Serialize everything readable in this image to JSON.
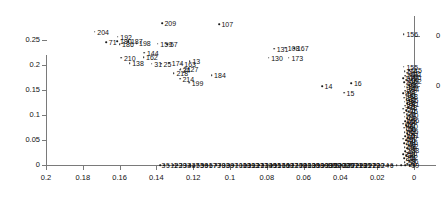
{
  "chart_data": {
    "type": "scatter",
    "title": "",
    "xlabel": "",
    "ylabel": "",
    "xlim": [
      0.2,
      0.0
    ],
    "ylim": [
      0.0,
      0.27
    ],
    "x_reversed": true,
    "grid": false,
    "legend": "none",
    "xticks": [
      "0.2",
      "0.18",
      "0.16",
      "0.14",
      "0.12",
      "0.1",
      "0.08",
      "0.06",
      "0.04",
      "0.02",
      "0"
    ],
    "xtick_values": [
      0.2,
      0.18,
      0.16,
      0.14,
      0.12,
      0.1,
      0.08,
      0.06,
      0.04,
      0.02,
      0
    ],
    "yticks": [
      "0",
      "0.05",
      "0.1",
      "0.15",
      "0.2",
      "0.25"
    ],
    "ytick_values": [
      0,
      0.05,
      0.1,
      0.15,
      0.2,
      0.25
    ],
    "right_axis": {
      "visible": true,
      "clipped": true,
      "ticklabels": [
        "0",
        "0"
      ]
    },
    "points": [
      {
        "label": "204",
        "x": 0.1735,
        "y": 0.2665
      },
      {
        "label": "192",
        "x": 0.161,
        "y": 0.2565
      },
      {
        "label": "71",
        "x": 0.1672,
        "y": 0.2455
      },
      {
        "label": "180",
        "x": 0.1612,
        "y": 0.248
      },
      {
        "label": "187",
        "x": 0.1552,
        "y": 0.248
      },
      {
        "label": "198",
        "x": 0.1508,
        "y": 0.244
      },
      {
        "label": "186",
        "x": 0.16,
        "y": 0.2415
      },
      {
        "label": "159",
        "x": 0.1392,
        "y": 0.243
      },
      {
        "label": "57",
        "x": 0.134,
        "y": 0.2415
      },
      {
        "label": "144",
        "x": 0.1465,
        "y": 0.2245
      },
      {
        "label": "162",
        "x": 0.147,
        "y": 0.216
      },
      {
        "label": "210",
        "x": 0.159,
        "y": 0.2145
      },
      {
        "label": "138",
        "x": 0.1545,
        "y": 0.2035
      },
      {
        "label": "31",
        "x": 0.1425,
        "y": 0.203
      },
      {
        "label": "25",
        "x": 0.1375,
        "y": 0.2025
      },
      {
        "label": "174",
        "x": 0.133,
        "y": 0.2045
      },
      {
        "label": "163",
        "x": 0.1262,
        "y": 0.203
      },
      {
        "label": "13",
        "x": 0.1218,
        "y": 0.2075
      },
      {
        "label": "21",
        "x": 0.1268,
        "y": 0.193
      },
      {
        "label": "27",
        "x": 0.1228,
        "y": 0.193
      },
      {
        "label": "24",
        "x": 0.1272,
        "y": 0.1905
      },
      {
        "label": "218",
        "x": 0.1305,
        "y": 0.1835
      },
      {
        "label": "214",
        "x": 0.1272,
        "y": 0.173
      },
      {
        "label": "199",
        "x": 0.1222,
        "y": 0.165
      },
      {
        "label": "184",
        "x": 0.11,
        "y": 0.18
      },
      {
        "label": "209",
        "x": 0.137,
        "y": 0.284
      },
      {
        "label": "107",
        "x": 0.106,
        "y": 0.282
      },
      {
        "label": "131",
        "x": 0.076,
        "y": 0.233
      },
      {
        "label": "108",
        "x": 0.07,
        "y": 0.235
      },
      {
        "label": "167",
        "x": 0.065,
        "y": 0.234
      },
      {
        "label": "130",
        "x": 0.079,
        "y": 0.215
      },
      {
        "label": "173",
        "x": 0.068,
        "y": 0.215
      },
      {
        "label": "14",
        "x": 0.05,
        "y": 0.158
      },
      {
        "label": "15",
        "x": 0.038,
        "y": 0.145
      },
      {
        "label": "16",
        "x": 0.034,
        "y": 0.164
      },
      {
        "label": "156",
        "x": 0.0055,
        "y": 0.2615
      },
      {
        "label": "155",
        "x": 0.0055,
        "y": 0.1965
      }
    ],
    "baseline_points": [
      {
        "label": "175",
        "x": 0.0485,
        "y": 0
      },
      {
        "label": "177",
        "x": 0.0395,
        "y": 0
      },
      {
        "label": "8",
        "x": 0.029,
        "y": 0
      }
    ],
    "baseline_cluster": {
      "note": "dense overlapping labeled points along y = 0",
      "x_range": [
        0.138,
        0.0
      ],
      "count": 60
    },
    "right_cluster": {
      "note": "dense overlapping labeled points at x near 0",
      "x": 0.004,
      "y_range": [
        0.0,
        0.19
      ],
      "count": 70
    }
  }
}
